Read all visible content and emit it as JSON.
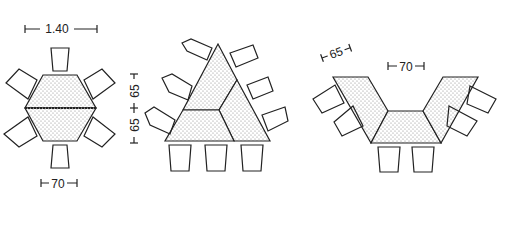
{
  "diagram": {
    "layouts": [
      {
        "name": "hexagon",
        "dimensions": {
          "width": "1.40",
          "edge": "70",
          "height_top": "65",
          "height_bottom": "65"
        },
        "chairs": 6
      },
      {
        "name": "triangle",
        "dimensions": {
          "height_top": "65",
          "height_bottom": "65"
        },
        "chairs": 9
      },
      {
        "name": "u-shape",
        "dimensions": {
          "depth": "65",
          "edge": "70"
        },
        "chairs": 6
      }
    ],
    "colors": {
      "line": "#222222",
      "fill": "#e8e8e8",
      "background": "#ffffff"
    }
  }
}
